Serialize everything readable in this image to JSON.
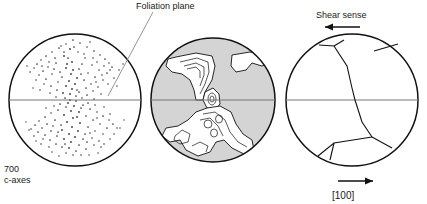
{
  "figure": {
    "type": "stereonet-triptych"
  },
  "labels": {
    "foliation_plane": "Foliation plane",
    "shear_sense": "Shear sense",
    "count": "700",
    "axes": "c-axes",
    "direction": "[100]"
  },
  "panels": [
    {
      "id": "scatter",
      "name": "c-axis point diagram",
      "center_x": 75,
      "center_y": 100,
      "radius": 66,
      "point_count": 700,
      "pattern": "crossed girdle (hourglass)",
      "has_horizontal_trace": true
    },
    {
      "id": "contour",
      "name": "contoured density diagram",
      "center_x": 213,
      "center_y": 100,
      "radius": 62,
      "background_fill": "#d4d4d4",
      "contour_fill": "#ffffff",
      "contour_levels": 5,
      "has_horizontal_trace": true
    },
    {
      "id": "skeleton",
      "name": "skeletal girdle with shear sense",
      "center_x": 352,
      "center_y": 100,
      "radius": 66,
      "has_horizontal_trace": true,
      "top_arrow_direction": "left",
      "bottom_arrow_direction": "right"
    }
  ],
  "colors": {
    "outline": "#111111",
    "shading": "#d4d4d4",
    "trace": "#777777",
    "leader": "#8a8a8a"
  }
}
